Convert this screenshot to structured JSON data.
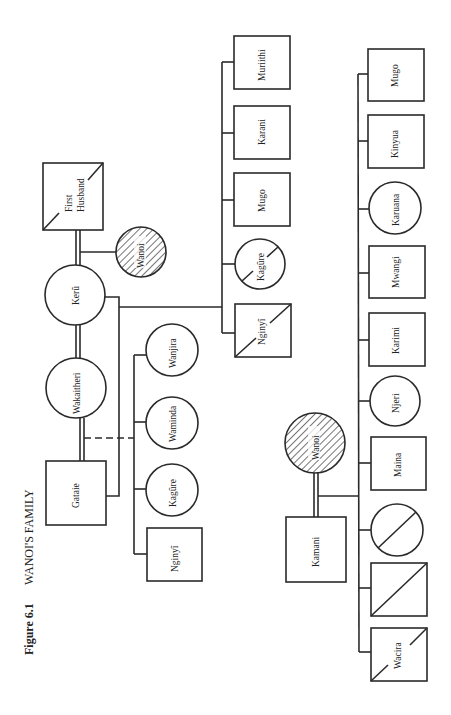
{
  "figure": {
    "number_label": "Figure 6.1",
    "title": "WANOI'S FAMILY",
    "orientation": "rotated 90 degrees counter-clockwise",
    "colors": {
      "line": "#2a2a2a",
      "background": "#ffffff",
      "hatch": "#2a2a2a"
    }
  },
  "people": {
    "first_husband": {
      "label_line1": "First",
      "label_line2": "Husband",
      "shape": "square",
      "deceased": true
    },
    "wanoi_top": {
      "label": "Wanoi",
      "shape": "circle",
      "ego": true
    },
    "keru": {
      "label": "Kerũ",
      "shape": "circle"
    },
    "wakaitheri": {
      "label": "Wakaitheri",
      "shape": "circle"
    },
    "gataie": {
      "label": "Gataie",
      "shape": "square"
    },
    "wanoi_bottom": {
      "label": "Wanoi",
      "shape": "circle",
      "ego": true
    },
    "kamani": {
      "label": "Kamani",
      "shape": "square"
    }
  },
  "keru_children": [
    {
      "label": "Muriithi",
      "shape": "square",
      "deceased": false
    },
    {
      "label": "Karani",
      "shape": "square",
      "deceased": false
    },
    {
      "label": "Mugo",
      "shape": "square",
      "deceased": false
    },
    {
      "label": "Kagũre",
      "shape": "circle",
      "deceased": true
    },
    {
      "label": "Nginyĩ",
      "shape": "square",
      "deceased": true
    }
  ],
  "gataie_children": [
    {
      "label": "Wanjira",
      "shape": "circle"
    },
    {
      "label": "Waminda",
      "shape": "circle"
    },
    {
      "label": "Kagũre",
      "shape": "circle"
    },
    {
      "label": "Nginyĩ",
      "shape": "square"
    }
  ],
  "wanoi_kamani_children": [
    {
      "label": "Mugo",
      "shape": "square",
      "deceased": false
    },
    {
      "label": "Kinyua",
      "shape": "square",
      "deceased": false
    },
    {
      "label": "Karuana",
      "shape": "circle",
      "deceased": false
    },
    {
      "label": "Mwangi",
      "shape": "square",
      "deceased": false
    },
    {
      "label": "Karimi",
      "shape": "square",
      "deceased": false
    },
    {
      "label": "Njeri",
      "shape": "circle",
      "deceased": false
    },
    {
      "label": "Maina",
      "shape": "square",
      "deceased": false
    },
    {
      "label": "",
      "shape": "circle",
      "deceased": true
    },
    {
      "label": "",
      "shape": "square",
      "deceased": true
    },
    {
      "label": "Wacira",
      "shape": "square",
      "deceased": true
    }
  ]
}
